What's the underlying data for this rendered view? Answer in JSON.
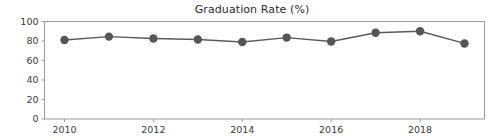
{
  "chart_data": {
    "type": "line",
    "title": "Graduation Rate (%)",
    "xlabel": "",
    "ylabel": "",
    "x": [
      2010,
      2011,
      2012,
      2013,
      2014,
      2015,
      2016,
      2017,
      2018,
      2019
    ],
    "values": [
      81,
      84.5,
      82.5,
      81.5,
      79,
      83.5,
      79.5,
      88.5,
      90,
      77.5
    ],
    "series": [
      {
        "name": "Graduation Rate (%)",
        "values": [
          81,
          84.5,
          82.5,
          81.5,
          79,
          83.5,
          79.5,
          88.5,
          90,
          77.5
        ]
      }
    ],
    "xtick_labels": [
      "2010",
      "2012",
      "2014",
      "2016",
      "2018"
    ],
    "xtick_values": [
      2010,
      2012,
      2014,
      2016,
      2018
    ],
    "ytick_labels": [
      "0",
      "20",
      "40",
      "60",
      "80",
      "100"
    ],
    "ytick_values": [
      0,
      20,
      40,
      60,
      80,
      100
    ],
    "xlim": [
      2009.55,
      2019.45
    ],
    "ylim": [
      0,
      100
    ],
    "grid": false,
    "legend": false,
    "legend_position": "none",
    "colors": {
      "line": "#5a5a5a",
      "marker": "#565656",
      "frame": "#9a9a9a",
      "text": "#2b2b2b",
      "background": "#ffffff"
    },
    "marker": "circle",
    "marker_size": 4.2,
    "line_width": 1.4
  }
}
